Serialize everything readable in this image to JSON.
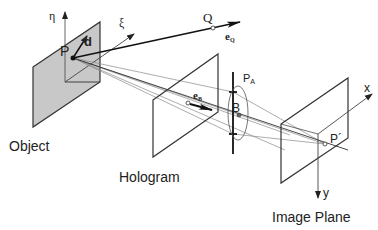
{
  "diagram": {
    "type": "holographic optical setup (isometric)",
    "planes": {
      "object": {
        "label": "Object",
        "fill": "#c8c8c8"
      },
      "hologram": {
        "label": "Hologram"
      },
      "image": {
        "label": "Image Plane"
      }
    },
    "points": {
      "object_point": "P",
      "far_point": "Q",
      "aperture_center": "B",
      "aperture": "P",
      "aperture_sub": "A",
      "image_point": "P´"
    },
    "vectors": {
      "d": "d",
      "eQ": "e",
      "eQ_sub": "Q",
      "eB": "e",
      "eB_sub": "B"
    },
    "axes": {
      "eta": "η",
      "xi": "ξ",
      "x": "x",
      "y": "y"
    },
    "colors": {
      "line": "#333333",
      "ray": "#8a8a8a",
      "object_fill": "#c8c8c8",
      "background": "#ffffff"
    }
  }
}
